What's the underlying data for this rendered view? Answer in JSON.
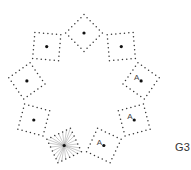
{
  "figure": {
    "label": "G3",
    "ring_center": [
      84,
      91
    ],
    "ring_radius": 58,
    "square_size": 26,
    "dots_per_side": 6,
    "dot_color": "#333333",
    "center_dot_color": "#111111",
    "ray_color": "#999999",
    "squares": [
      {
        "id": "top",
        "angle_deg": -90,
        "label": "",
        "starburst": false
      },
      {
        "id": "upper-right",
        "angle_deg": -50,
        "label": "",
        "starburst": false
      },
      {
        "id": "right",
        "angle_deg": -10,
        "label": "A",
        "starburst": false
      },
      {
        "id": "lower-right",
        "angle_deg": 30,
        "label": "A",
        "starburst": false
      },
      {
        "id": "bottom-right",
        "angle_deg": 70,
        "label": "A",
        "starburst": false
      },
      {
        "id": "bottom-left",
        "angle_deg": 110,
        "label": "",
        "starburst": true
      },
      {
        "id": "lower-left",
        "angle_deg": 150,
        "label": "",
        "starburst": false
      },
      {
        "id": "left",
        "angle_deg": 190,
        "label": "",
        "starburst": false
      },
      {
        "id": "upper-left",
        "angle_deg": 230,
        "label": "",
        "starburst": false
      }
    ]
  }
}
